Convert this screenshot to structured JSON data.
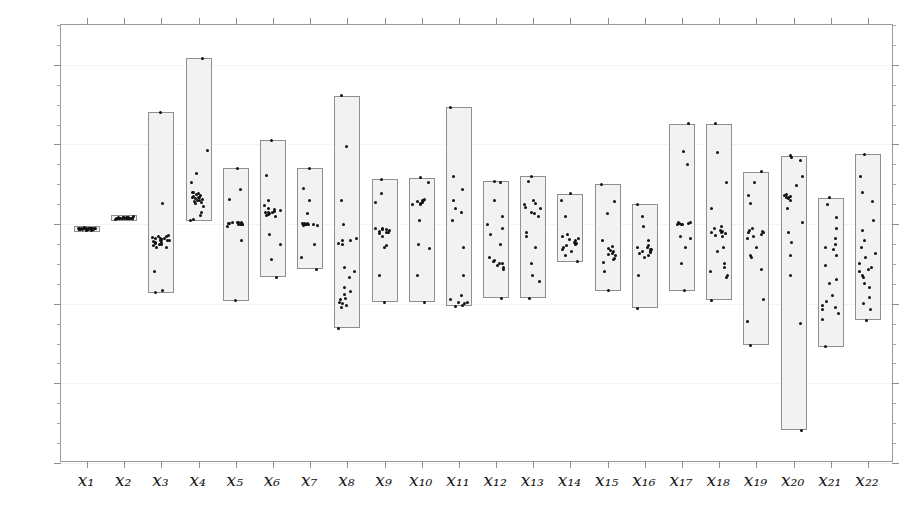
{
  "chart_data": {
    "type": "bar",
    "title": "",
    "subtitle": "",
    "xlabel": "",
    "ylabel": "",
    "grid": false,
    "legend": null,
    "ylim": [
      -0.6,
      0.5
    ],
    "xlim": [
      0.3,
      22.7
    ],
    "ytick_labels": [
      "0.4",
      "0.2",
      "0.0",
      "-0.2",
      "-0.4",
      "-0.6"
    ],
    "ytick_values": [
      0.4,
      0.2,
      0.0,
      -0.2,
      -0.4,
      -0.6
    ],
    "ytick_minor_step": 0.05,
    "categories": [
      "x1",
      "x2",
      "x3",
      "x4",
      "x5",
      "x6",
      "x7",
      "x8",
      "x9",
      "x10",
      "x11",
      "x12",
      "x13",
      "x14",
      "x15",
      "x16",
      "x17",
      "x18",
      "x19",
      "x20",
      "x21",
      "x22"
    ],
    "category_labels": [
      "x₁",
      "x₂",
      "x₃",
      "x₄",
      "x₅",
      "x₆",
      "x₇",
      "x₈",
      "x₉",
      "x₁₀",
      "x₁₁",
      "x₁₂",
      "x₁₃",
      "x₁₄",
      "x₁₅",
      "x₁₆",
      "x₁₇",
      "x₁₈",
      "x₁₉",
      "x₂₀",
      "x₂₁",
      "x₂₂"
    ],
    "series": [
      {
        "name": "range_box",
        "type": "range",
        "note": "Each box spans the min-to-max range of the scatter values for that variable.",
        "ranges": [
          {
            "category": "x1",
            "low": -0.02,
            "high": -0.005
          },
          {
            "category": "x2",
            "low": 0.008,
            "high": 0.022
          },
          {
            "category": "x3",
            "low": -0.172,
            "high": 0.281
          },
          {
            "category": "x4",
            "low": 0.008,
            "high": 0.416
          },
          {
            "category": "x5",
            "low": -0.192,
            "high": 0.14
          },
          {
            "category": "x6",
            "low": -0.133,
            "high": 0.211
          },
          {
            "category": "x7",
            "low": -0.113,
            "high": 0.14
          },
          {
            "category": "x8",
            "low": -0.262,
            "high": 0.322
          },
          {
            "category": "x9",
            "low": -0.196,
            "high": 0.112
          },
          {
            "category": "x10",
            "low": -0.196,
            "high": 0.117
          },
          {
            "category": "x11",
            "low": -0.206,
            "high": 0.293
          },
          {
            "category": "x12",
            "low": -0.186,
            "high": 0.107
          },
          {
            "category": "x13",
            "low": -0.186,
            "high": 0.12
          },
          {
            "category": "x14",
            "low": -0.095,
            "high": 0.076
          },
          {
            "category": "x15",
            "low": -0.167,
            "high": 0.1
          },
          {
            "category": "x16",
            "low": -0.211,
            "high": 0.05
          },
          {
            "category": "x17",
            "low": -0.167,
            "high": 0.252
          },
          {
            "category": "x18",
            "low": -0.191,
            "high": 0.252
          },
          {
            "category": "x19",
            "low": -0.304,
            "high": 0.131
          },
          {
            "category": "x20",
            "low": -0.518,
            "high": 0.172
          },
          {
            "category": "x21",
            "low": -0.308,
            "high": 0.066
          },
          {
            "category": "x22",
            "low": -0.241,
            "high": 0.176
          }
        ]
      },
      {
        "name": "observations",
        "type": "scatter",
        "note": "Individual observation points overlaid on each range box.",
        "points": [
          {
            "category": "x1",
            "values": [
              -0.012,
              -0.011,
              -0.013,
              -0.01,
              -0.014,
              -0.012,
              -0.011,
              -0.015,
              -0.009,
              -0.013,
              -0.012,
              -0.016,
              -0.011,
              -0.01,
              -0.013,
              -0.012,
              -0.014,
              -0.011,
              -0.012,
              -0.013,
              -0.01,
              -0.012,
              -0.014,
              -0.011,
              -0.013
            ]
          },
          {
            "category": "x2",
            "values": [
              0.015,
              0.014,
              0.016,
              0.013,
              0.017,
              0.015,
              0.014,
              0.012,
              0.016,
              0.015,
              0.018,
              0.014,
              0.013,
              0.016,
              0.015,
              0.014,
              0.017,
              0.015,
              0.013,
              0.016,
              0.015,
              0.014,
              0.016,
              0.015,
              0.014
            ]
          },
          {
            "category": "x3",
            "values": [
              0.281,
              0.052,
              -0.03,
              -0.038,
              -0.045,
              -0.04,
              -0.032,
              -0.048,
              -0.035,
              -0.042,
              -0.05,
              -0.028,
              -0.055,
              -0.037,
              -0.043,
              -0.036,
              -0.06,
              -0.047,
              -0.033,
              -0.058,
              -0.041,
              -0.052,
              -0.039,
              -0.12,
              -0.168,
              -0.172
            ]
          },
          {
            "category": "x4",
            "values": [
              0.416,
              0.186,
              0.128,
              0.104,
              0.08,
              0.072,
              0.068,
              0.064,
              0.07,
              0.076,
              0.062,
              0.058,
              0.066,
              0.074,
              0.06,
              0.056,
              0.08,
              0.068,
              0.055,
              0.052,
              0.045,
              0.03,
              0.022,
              0.012,
              0.008
            ]
          },
          {
            "category": "x5",
            "values": [
              0.14,
              0.086,
              0.062,
              0.004,
              0.002,
              0.0,
              0.003,
              -0.002,
              0.001,
              0.004,
              0.002,
              -0.001,
              0.0,
              0.003,
              -0.005,
              -0.04,
              -0.192
            ]
          },
          {
            "category": "x6",
            "values": [
              0.211,
              0.122,
              0.06,
              0.046,
              0.038,
              0.032,
              0.03,
              0.034,
              0.028,
              0.036,
              0.026,
              0.024,
              0.03,
              0.022,
              0.02,
              -0.026,
              -0.05,
              -0.09,
              -0.133
            ]
          },
          {
            "category": "x7",
            "values": [
              0.14,
              0.09,
              0.06,
              0.026,
              0.0,
              -0.002,
              0.001,
              -0.003,
              0.0,
              0.002,
              -0.004,
              0.001,
              -0.001,
              -0.05,
              -0.084,
              -0.113
            ]
          },
          {
            "category": "x8",
            "values": [
              0.322,
              0.196,
              0.058,
              0.0,
              -0.036,
              -0.04,
              -0.048,
              -0.042,
              -0.052,
              -0.11,
              -0.12,
              -0.135,
              -0.16,
              -0.178,
              -0.17,
              -0.19,
              -0.196,
              -0.186,
              -0.2,
              -0.205,
              -0.21,
              -0.262
            ]
          },
          {
            "category": "x9",
            "values": [
              0.112,
              0.076,
              0.055,
              -0.01,
              -0.014,
              -0.018,
              -0.012,
              -0.02,
              -0.016,
              -0.024,
              -0.013,
              -0.03,
              -0.022,
              -0.055,
              -0.06,
              -0.13,
              -0.196
            ]
          },
          {
            "category": "x10",
            "values": [
              0.117,
              0.104,
              0.062,
              0.06,
              0.056,
              0.058,
              0.052,
              0.05,
              0.054,
              0.048,
              0.01,
              -0.05,
              -0.062,
              -0.13,
              -0.196
            ]
          },
          {
            "category": "x11",
            "values": [
              0.293,
              0.12,
              0.088,
              0.06,
              0.04,
              0.03,
              0.01,
              -0.06,
              -0.13,
              -0.18,
              -0.196,
              -0.2,
              -0.204,
              -0.206,
              -0.19,
              -0.198
            ]
          },
          {
            "category": "x12",
            "values": [
              0.107,
              0.105,
              0.06,
              0.018,
              0.0,
              -0.01,
              -0.025,
              -0.05,
              -0.085,
              -0.095,
              -0.1,
              -0.092,
              -0.105,
              -0.098,
              -0.11,
              -0.115,
              -0.186
            ]
          },
          {
            "category": "x13",
            "values": [
              0.12,
              0.108,
              0.06,
              0.048,
              0.052,
              0.042,
              0.038,
              0.03,
              0.026,
              0.018,
              -0.02,
              -0.03,
              -0.06,
              -0.1,
              -0.13,
              -0.145,
              -0.186
            ]
          },
          {
            "category": "x14",
            "values": [
              0.076,
              0.06,
              0.02,
              -0.025,
              -0.03,
              -0.038,
              -0.042,
              -0.036,
              -0.046,
              -0.05,
              -0.055,
              -0.048,
              -0.06,
              -0.065,
              -0.07,
              -0.08,
              -0.095
            ]
          },
          {
            "category": "x15",
            "values": [
              0.1,
              0.056,
              0.026,
              -0.04,
              -0.056,
              -0.062,
              -0.07,
              -0.066,
              -0.076,
              -0.08,
              -0.086,
              -0.074,
              -0.09,
              -0.096,
              -0.12,
              -0.167
            ]
          },
          {
            "category": "x16",
            "values": [
              0.05,
              0.02,
              -0.005,
              -0.04,
              -0.055,
              -0.06,
              -0.065,
              -0.058,
              -0.07,
              -0.064,
              -0.075,
              -0.068,
              -0.08,
              -0.072,
              -0.085,
              -0.13,
              -0.211
            ]
          },
          {
            "category": "x17",
            "values": [
              0.252,
              0.182,
              0.15,
              0.004,
              0.002,
              0.0,
              0.003,
              -0.002,
              0.0,
              0.001,
              -0.03,
              -0.035,
              -0.06,
              -0.1,
              -0.167
            ]
          },
          {
            "category": "x18",
            "values": [
              0.252,
              0.18,
              0.104,
              0.04,
              -0.005,
              -0.012,
              -0.02,
              -0.016,
              -0.024,
              -0.018,
              -0.028,
              -0.022,
              -0.032,
              -0.06,
              -0.07,
              -0.1,
              -0.11,
              -0.12,
              -0.13,
              -0.135,
              -0.191
            ]
          },
          {
            "category": "x19",
            "values": [
              0.131,
              0.104,
              0.072,
              0.052,
              -0.01,
              -0.02,
              -0.016,
              -0.025,
              -0.018,
              -0.03,
              -0.022,
              -0.036,
              -0.06,
              -0.08,
              -0.085,
              -0.115,
              -0.19,
              -0.245,
              -0.304
            ]
          },
          {
            "category": "x20",
            "values": [
              0.172,
              0.168,
              0.16,
              0.12,
              0.096,
              0.07,
              0.068,
              0.072,
              0.066,
              0.074,
              0.06,
              0.064,
              0.04,
              0.004,
              -0.02,
              -0.045,
              -0.08,
              -0.13,
              -0.25,
              -0.518
            ]
          },
          {
            "category": "x21",
            "values": [
              0.066,
              0.05,
              0.016,
              -0.01,
              -0.035,
              -0.05,
              -0.06,
              -0.065,
              -0.08,
              -0.105,
              -0.14,
              -0.15,
              -0.18,
              -0.195,
              -0.205,
              -0.21,
              -0.215,
              -0.225,
              -0.24,
              -0.308
            ]
          },
          {
            "category": "x22",
            "values": [
              0.176,
              0.12,
              0.08,
              0.056,
              0.01,
              -0.016,
              -0.04,
              -0.06,
              -0.075,
              -0.085,
              -0.1,
              -0.108,
              -0.12,
              -0.115,
              -0.128,
              -0.135,
              -0.15,
              -0.16,
              -0.185,
              -0.2,
              -0.215,
              -0.241
            ]
          }
        ]
      }
    ],
    "colors": {
      "box_fill": "#f2f2f2",
      "box_edge": "#8f8f8f",
      "point": "#111111",
      "axis": "#8d8d8d",
      "text": "#1a1a1a"
    }
  }
}
